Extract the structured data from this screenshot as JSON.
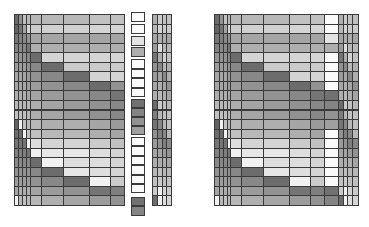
{
  "chart_data": [
    {
      "type": "heatmap",
      "name": "left-matrix",
      "title": "",
      "xlabel": "",
      "ylabel": "",
      "grid": true,
      "legend": "none",
      "colormap": "grayscale (0=white, 1=black)",
      "x_edges_px": [
        14,
        18,
        22,
        26,
        30,
        41,
        63,
        89,
        110,
        124
      ],
      "y_top_px": 14,
      "y_bottom_px": 205,
      "rows": 20,
      "values": [
        [
          0.75,
          0.55,
          0.3,
          0.35,
          0.35,
          0.35,
          0.35,
          0.3,
          0.3
        ],
        [
          0.8,
          0.7,
          0.45,
          0.2,
          0.25,
          0.22,
          0.22,
          0.2,
          0.2
        ],
        [
          0.7,
          0.65,
          0.6,
          0.55,
          0.45,
          0.45,
          0.45,
          0.45,
          0.45
        ],
        [
          0.65,
          0.6,
          0.6,
          0.7,
          0.4,
          0.4,
          0.4,
          0.4,
          0.4
        ],
        [
          0.55,
          0.55,
          0.55,
          0.6,
          0.75,
          0.2,
          0.2,
          0.2,
          0.2
        ],
        [
          0.5,
          0.5,
          0.5,
          0.55,
          0.6,
          0.75,
          0.25,
          0.25,
          0.25
        ],
        [
          0.45,
          0.45,
          0.45,
          0.5,
          0.55,
          0.6,
          0.75,
          0.2,
          0.2
        ],
        [
          0.45,
          0.45,
          0.45,
          0.5,
          0.5,
          0.55,
          0.6,
          0.75,
          0.55
        ],
        [
          0.4,
          0.4,
          0.4,
          0.45,
          0.45,
          0.5,
          0.55,
          0.6,
          0.7
        ],
        [
          0.35,
          0.35,
          0.35,
          0.35,
          0.4,
          0.45,
          0.5,
          0.55,
          0.6
        ],
        [
          0.3,
          0.3,
          0.3,
          0.35,
          0.4,
          0.45,
          0.5,
          0.55,
          0.6
        ],
        [
          0.8,
          0.05,
          0.3,
          0.35,
          0.35,
          0.4,
          0.4,
          0.45,
          0.5
        ],
        [
          0.75,
          0.75,
          0.05,
          0.3,
          0.3,
          0.35,
          0.35,
          0.4,
          0.45
        ],
        [
          0.7,
          0.7,
          0.7,
          0.05,
          0.15,
          0.2,
          0.2,
          0.25,
          0.3
        ],
        [
          0.65,
          0.65,
          0.65,
          0.7,
          0.05,
          0.1,
          0.1,
          0.15,
          0.2
        ],
        [
          0.6,
          0.6,
          0.6,
          0.6,
          0.75,
          0.05,
          0.15,
          0.15,
          0.2
        ],
        [
          0.55,
          0.55,
          0.55,
          0.55,
          0.6,
          0.75,
          0.1,
          0.15,
          0.2
        ],
        [
          0.5,
          0.5,
          0.5,
          0.5,
          0.55,
          0.6,
          0.75,
          0.05,
          0.25
        ],
        [
          0.45,
          0.4,
          0.4,
          0.4,
          0.45,
          0.5,
          0.55,
          0.7,
          0.65
        ],
        [
          0.05,
          0.35,
          0.3,
          0.35,
          0.35,
          0.4,
          0.45,
          0.5,
          0.55
        ]
      ]
    },
    {
      "type": "heatmap",
      "name": "middle-column",
      "x_edges_px": [
        131,
        145
      ],
      "boxes": [
        {
          "y": 12,
          "h": 10,
          "v": 0.0
        },
        {
          "y": 24,
          "h": 10,
          "v": 0.0
        },
        {
          "y": 36,
          "h": 10,
          "v": 0.12
        },
        {
          "y": 47,
          "h": 10,
          "v": 0.4
        },
        {
          "y": 59,
          "h": 10,
          "v": 0.0
        },
        {
          "y": 69,
          "h": 9,
          "v": 0.0
        },
        {
          "y": 78,
          "h": 10,
          "v": 0.0
        },
        {
          "y": 88,
          "h": 9,
          "v": 0.0
        },
        {
          "y": 99,
          "h": 9,
          "v": 0.72
        },
        {
          "y": 108,
          "h": 9,
          "v": 0.62
        },
        {
          "y": 117,
          "h": 9,
          "v": 0.55
        },
        {
          "y": 126,
          "h": 9,
          "v": 0.48
        },
        {
          "y": 137,
          "h": 9,
          "v": 0.0
        },
        {
          "y": 146,
          "h": 10,
          "v": 0.0
        },
        {
          "y": 156,
          "h": 9,
          "v": 0.0
        },
        {
          "y": 165,
          "h": 10,
          "v": 0.0
        },
        {
          "y": 175,
          "h": 9,
          "v": 0.0
        },
        {
          "y": 184,
          "h": 9,
          "v": 0.0
        },
        {
          "y": 197,
          "h": 9,
          "v": 0.72
        },
        {
          "y": 206,
          "h": 10,
          "v": 0.62
        }
      ]
    },
    {
      "type": "heatmap",
      "name": "narrow-matrix",
      "x_edges_px": [
        152,
        157,
        162,
        166,
        171
      ],
      "y_top_px": 14,
      "y_bottom_px": 205,
      "rows": 20,
      "values": [
        [
          0.4,
          0.25,
          0.3,
          0.3
        ],
        [
          0.35,
          0.2,
          0.25,
          0.25
        ],
        [
          0.45,
          0.4,
          0.4,
          0.45
        ],
        [
          0.5,
          0.15,
          0.35,
          0.35
        ],
        [
          0.7,
          0.4,
          0.2,
          0.3
        ],
        [
          0.55,
          0.6,
          0.35,
          0.4
        ],
        [
          0.5,
          0.45,
          0.6,
          0.4
        ],
        [
          0.45,
          0.4,
          0.45,
          0.55
        ],
        [
          0.4,
          0.35,
          0.4,
          0.45
        ],
        [
          0.75,
          0.25,
          0.3,
          0.35
        ],
        [
          0.65,
          0.35,
          0.3,
          0.3
        ],
        [
          0.7,
          0.6,
          0.35,
          0.3
        ],
        [
          0.55,
          0.65,
          0.6,
          0.35
        ],
        [
          0.5,
          0.55,
          0.65,
          0.6
        ],
        [
          0.45,
          0.45,
          0.5,
          0.55
        ],
        [
          0.4,
          0.4,
          0.4,
          0.45
        ],
        [
          0.35,
          0.3,
          0.35,
          0.35
        ],
        [
          0.3,
          0.25,
          0.3,
          0.3
        ],
        [
          0.25,
          0.05,
          0.2,
          0.25
        ],
        [
          0.75,
          0.05,
          0.15,
          0.2
        ]
      ]
    },
    {
      "type": "heatmap",
      "name": "right-matrix",
      "x_edges_px": [
        214,
        219,
        223,
        227,
        230,
        241,
        263,
        289,
        310,
        324,
        338,
        343,
        347,
        352,
        358
      ],
      "y_top_px": 14,
      "y_bottom_px": 205,
      "rows": 20,
      "values": [
        [
          0.75,
          0.55,
          0.3,
          0.35,
          0.35,
          0.35,
          0.35,
          0.3,
          0.3,
          0.0,
          0.4,
          0.25,
          0.3,
          0.3
        ],
        [
          0.8,
          0.7,
          0.45,
          0.2,
          0.25,
          0.22,
          0.22,
          0.2,
          0.2,
          0.0,
          0.35,
          0.2,
          0.25,
          0.25
        ],
        [
          0.7,
          0.65,
          0.6,
          0.55,
          0.45,
          0.45,
          0.45,
          0.45,
          0.45,
          0.12,
          0.45,
          0.4,
          0.4,
          0.45
        ],
        [
          0.65,
          0.6,
          0.6,
          0.7,
          0.4,
          0.4,
          0.4,
          0.4,
          0.4,
          0.4,
          0.5,
          0.15,
          0.35,
          0.35
        ],
        [
          0.55,
          0.55,
          0.55,
          0.6,
          0.75,
          0.2,
          0.2,
          0.2,
          0.2,
          0.0,
          0.7,
          0.4,
          0.2,
          0.3
        ],
        [
          0.5,
          0.5,
          0.5,
          0.55,
          0.6,
          0.75,
          0.25,
          0.25,
          0.25,
          0.0,
          0.55,
          0.6,
          0.35,
          0.4
        ],
        [
          0.45,
          0.45,
          0.45,
          0.5,
          0.55,
          0.6,
          0.75,
          0.2,
          0.2,
          0.0,
          0.5,
          0.45,
          0.6,
          0.4
        ],
        [
          0.45,
          0.45,
          0.45,
          0.5,
          0.5,
          0.55,
          0.6,
          0.75,
          0.55,
          0.0,
          0.45,
          0.4,
          0.45,
          0.55
        ],
        [
          0.4,
          0.4,
          0.4,
          0.45,
          0.45,
          0.5,
          0.55,
          0.6,
          0.7,
          0.72,
          0.4,
          0.35,
          0.4,
          0.45
        ],
        [
          0.35,
          0.35,
          0.35,
          0.35,
          0.4,
          0.45,
          0.5,
          0.55,
          0.6,
          0.62,
          0.75,
          0.25,
          0.3,
          0.35
        ],
        [
          0.3,
          0.3,
          0.3,
          0.35,
          0.4,
          0.45,
          0.5,
          0.55,
          0.6,
          0.55,
          0.65,
          0.35,
          0.3,
          0.3
        ],
        [
          0.8,
          0.05,
          0.3,
          0.35,
          0.35,
          0.4,
          0.4,
          0.45,
          0.5,
          0.48,
          0.7,
          0.6,
          0.35,
          0.3
        ],
        [
          0.75,
          0.75,
          0.05,
          0.3,
          0.3,
          0.35,
          0.35,
          0.4,
          0.45,
          0.0,
          0.55,
          0.65,
          0.6,
          0.35
        ],
        [
          0.7,
          0.7,
          0.7,
          0.05,
          0.15,
          0.2,
          0.2,
          0.25,
          0.3,
          0.0,
          0.5,
          0.55,
          0.65,
          0.6
        ],
        [
          0.65,
          0.65,
          0.65,
          0.7,
          0.05,
          0.1,
          0.1,
          0.15,
          0.2,
          0.0,
          0.45,
          0.45,
          0.5,
          0.55
        ],
        [
          0.6,
          0.6,
          0.6,
          0.6,
          0.75,
          0.05,
          0.15,
          0.15,
          0.2,
          0.0,
          0.4,
          0.4,
          0.4,
          0.45
        ],
        [
          0.55,
          0.55,
          0.55,
          0.55,
          0.6,
          0.75,
          0.1,
          0.15,
          0.2,
          0.0,
          0.35,
          0.3,
          0.35,
          0.35
        ],
        [
          0.5,
          0.5,
          0.5,
          0.5,
          0.55,
          0.6,
          0.75,
          0.05,
          0.25,
          0.0,
          0.3,
          0.25,
          0.3,
          0.3
        ],
        [
          0.45,
          0.4,
          0.4,
          0.4,
          0.45,
          0.5,
          0.55,
          0.7,
          0.65,
          0.72,
          0.25,
          0.05,
          0.2,
          0.25
        ],
        [
          0.05,
          0.35,
          0.3,
          0.35,
          0.35,
          0.4,
          0.45,
          0.5,
          0.55,
          0.62,
          0.75,
          0.05,
          0.15,
          0.2
        ]
      ]
    }
  ]
}
